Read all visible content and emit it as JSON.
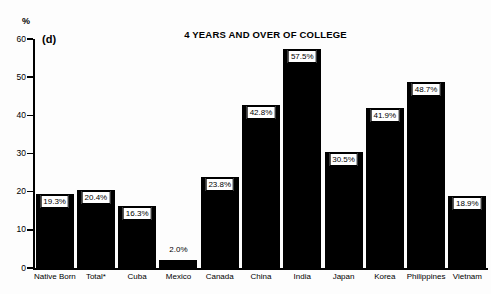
{
  "chart_data": {
    "type": "bar",
    "title": "4 YEARS AND OVER OF COLLEGE",
    "panel_label": "(d)",
    "xlabel": "",
    "ylabel": "%",
    "ylim": [
      0,
      60
    ],
    "yticks": [
      0,
      10,
      20,
      30,
      40,
      50,
      60
    ],
    "ytick_labels": [
      "0",
      "10",
      "20",
      "30",
      "40",
      "50",
      "60"
    ],
    "grid": false,
    "legend": null,
    "categories": [
      "Native Born",
      "Total*",
      "Cuba",
      "Mexico",
      "Canada",
      "China",
      "India",
      "Japan",
      "Korea",
      "Philippines",
      "Vietnam"
    ],
    "values": [
      19.3,
      20.4,
      16.3,
      2.0,
      23.8,
      42.8,
      57.5,
      30.5,
      41.9,
      48.7,
      18.9
    ],
    "value_labels": [
      "19.3%",
      "20.4%",
      "16.3%",
      "2.0%",
      "23.8%",
      "42.8%",
      "57.5%",
      "30.5%",
      "41.9%",
      "48.7%",
      "18.9%"
    ],
    "label_placement": [
      "inside",
      "inside",
      "inside",
      "above-outside",
      "inside",
      "inside",
      "inside",
      "inside",
      "inside",
      "inside",
      "inside"
    ],
    "bar_color": "#000000",
    "label_box_fill": "#ffffff",
    "label_box_border": "#000000",
    "background_color": "#fdfdfd"
  }
}
